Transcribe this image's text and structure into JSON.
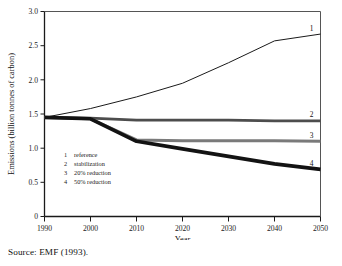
{
  "chart_data": {
    "type": "line",
    "title": "",
    "xlabel": "Year",
    "ylabel": "Emissions (billion tonnes of carbon)",
    "xlim": [
      1990,
      2050
    ],
    "ylim": [
      0,
      3.0
    ],
    "xticks": [
      "1990",
      "2000",
      "2010",
      "2020",
      "2030",
      "2040",
      "2050"
    ],
    "yticks": [
      "0",
      "0.5",
      "1.0",
      "1.5",
      "2.0",
      "2.5",
      "3.0"
    ],
    "grid": false,
    "legend_position": "inside-lower-left",
    "x": [
      1990,
      2000,
      2010,
      2020,
      2030,
      2040,
      2050
    ],
    "series": [
      {
        "name": "reference",
        "key": "1",
        "label": "1",
        "color": "#1a1a1a",
        "width": 1.0,
        "values": [
          1.45,
          1.58,
          1.75,
          1.95,
          2.25,
          2.57,
          2.67
        ]
      },
      {
        "name": "stabilization",
        "key": "2",
        "label": "2",
        "color": "#4d4d4d",
        "width": 2.6,
        "values": [
          1.45,
          1.44,
          1.41,
          1.41,
          1.41,
          1.4,
          1.4
        ]
      },
      {
        "name": "20% reduction",
        "key": "3",
        "label": "3",
        "color": "#7a7a7a",
        "width": 3.0,
        "values": [
          1.45,
          1.43,
          1.12,
          1.11,
          1.11,
          1.11,
          1.1
        ]
      },
      {
        "name": "50% reduction",
        "key": "4",
        "label": "4",
        "color": "#131313",
        "width": 3.6,
        "values": [
          1.45,
          1.43,
          1.1,
          0.99,
          0.88,
          0.77,
          0.69
        ]
      }
    ],
    "legend": [
      {
        "num": "1",
        "label": "reference"
      },
      {
        "num": "2",
        "label": "stabilization"
      },
      {
        "num": "3",
        "label": "20% reduction"
      },
      {
        "num": "4",
        "label": "50% reduction"
      }
    ],
    "annotations": [
      {
        "name": "curve-end-label-1",
        "text": "1",
        "series": "reference"
      },
      {
        "name": "curve-end-label-2",
        "text": "2",
        "series": "stabilization"
      },
      {
        "name": "curve-end-label-3",
        "text": "3",
        "series": "20% reduction"
      },
      {
        "name": "curve-end-label-4",
        "text": "4",
        "series": "50% reduction"
      }
    ]
  },
  "caption": {
    "source": "Source: EMF (1993)."
  }
}
